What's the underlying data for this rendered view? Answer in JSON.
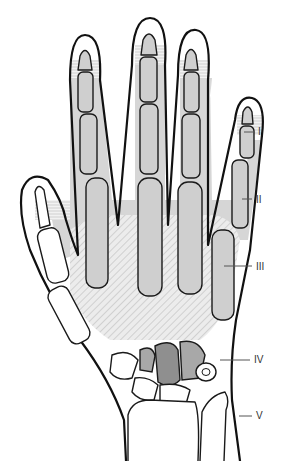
{
  "figure": {
    "labels": [
      {
        "id": "I",
        "text": "I",
        "x": 258,
        "y": 132
      },
      {
        "id": "II",
        "text": "II",
        "x": 256,
        "y": 200
      },
      {
        "id": "III",
        "text": "III",
        "x": 256,
        "y": 266
      },
      {
        "id": "IV",
        "text": "IV",
        "x": 254,
        "y": 359
      },
      {
        "id": "V",
        "text": "V",
        "x": 256,
        "y": 416
      }
    ],
    "colors": {
      "outline": "#111111",
      "bone_fill": "#cfcfcf",
      "shaded_zone": "#d6d6d6",
      "carpal_dark": "#8f8f8f",
      "carpal_mid": "#a8a8a8",
      "background": "#ffffff"
    }
  }
}
